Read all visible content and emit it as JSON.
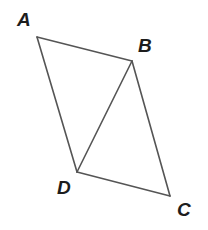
{
  "figure": {
    "kind": "quadrilateral-with-diagonal",
    "canvas": {
      "width": 208,
      "height": 230
    },
    "background_color": "#ffffff",
    "stroke_color": "#555555",
    "stroke_width": 1.6,
    "label_color": "#1d1d1d",
    "vertices": [
      {
        "id": "A",
        "label": "A",
        "x": 37,
        "y": 37,
        "label_x": 17,
        "label_y": 10
      },
      {
        "id": "B",
        "label": "B",
        "x": 132,
        "y": 61,
        "label_x": 138,
        "label_y": 36
      },
      {
        "id": "C",
        "label": "C",
        "x": 170,
        "y": 196,
        "label_x": 177,
        "label_y": 200
      },
      {
        "id": "D",
        "label": "D",
        "x": 77,
        "y": 172,
        "label_x": 57,
        "label_y": 178
      }
    ],
    "edges": [
      {
        "id": "AB",
        "from": "A",
        "to": "B",
        "type": "side",
        "path": "M 37 37 L 132 61"
      },
      {
        "id": "BC",
        "from": "B",
        "to": "C",
        "type": "side",
        "path": "M 132 61 L 170 196"
      },
      {
        "id": "CD",
        "from": "C",
        "to": "D",
        "type": "side",
        "path": "M 170 196 L 77 172"
      },
      {
        "id": "DA",
        "from": "D",
        "to": "A",
        "type": "side",
        "path": "M 77 172 L 37 37"
      },
      {
        "id": "BD",
        "from": "B",
        "to": "D",
        "type": "diagonal",
        "path": "M 132 61 L 77 172"
      }
    ],
    "outline_path": "M 37 37 L 132 61 L 170 196 L 77 172 Z",
    "triangles": [
      {
        "id": "ABD",
        "vertices": "A, B, D"
      },
      {
        "id": "BCD",
        "vertices": "B, C, D"
      }
    ]
  }
}
